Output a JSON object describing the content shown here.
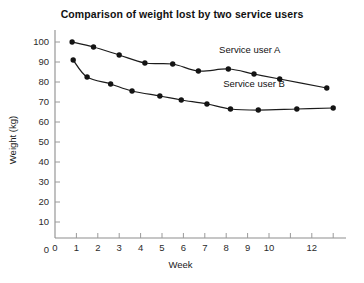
{
  "chart_data": {
    "type": "line",
    "title": "Comparison of weight lost by two service users",
    "xlabel": "Week",
    "ylabel": "Weight (kg)",
    "xlim": [
      0,
      13.6
    ],
    "ylim": [
      0,
      105
    ],
    "grid": false,
    "legend_position": "inline-right",
    "x_ticks": [
      0,
      1,
      2,
      3,
      4,
      5,
      6,
      7,
      8,
      9,
      10,
      11,
      12,
      13
    ],
    "x_tick_labels": [
      "0",
      "1",
      "2",
      "3",
      "4",
      "5",
      "6",
      "7",
      "8",
      "9",
      "10",
      "",
      "12",
      ""
    ],
    "y_ticks": [
      0,
      10,
      20,
      30,
      40,
      50,
      60,
      70,
      80,
      90,
      100
    ],
    "y_tick_labels": [
      "0",
      "10",
      "20",
      "30",
      "40",
      "50",
      "60",
      "70",
      "80",
      "90",
      "100"
    ],
    "series": [
      {
        "name": "Service user A",
        "label_text": "Service user A",
        "color": "#141414",
        "x": [
          0.8,
          1.8,
          3.0,
          4.2,
          5.5,
          6.7,
          8.1,
          9.3,
          10.5,
          12.7
        ],
        "values": [
          100,
          97.5,
          93.5,
          89.5,
          89,
          85.5,
          86.5,
          84,
          81.5,
          77
        ]
      },
      {
        "name": "Service user B",
        "label_text": "Service user B",
        "color": "#141414",
        "x": [
          0.85,
          1.5,
          2.6,
          3.6,
          4.9,
          5.9,
          7.1,
          8.2,
          9.5,
          11.3,
          13.0
        ],
        "values": [
          91,
          82.5,
          79,
          75.5,
          73,
          71,
          69,
          66.5,
          66,
          66.5,
          67
        ]
      }
    ],
    "annotations": [
      {
        "text": "Service user A",
        "x": 9.1,
        "y": 94.5
      },
      {
        "text": "Service user B",
        "x": 9.3,
        "y": 77.5
      }
    ]
  }
}
